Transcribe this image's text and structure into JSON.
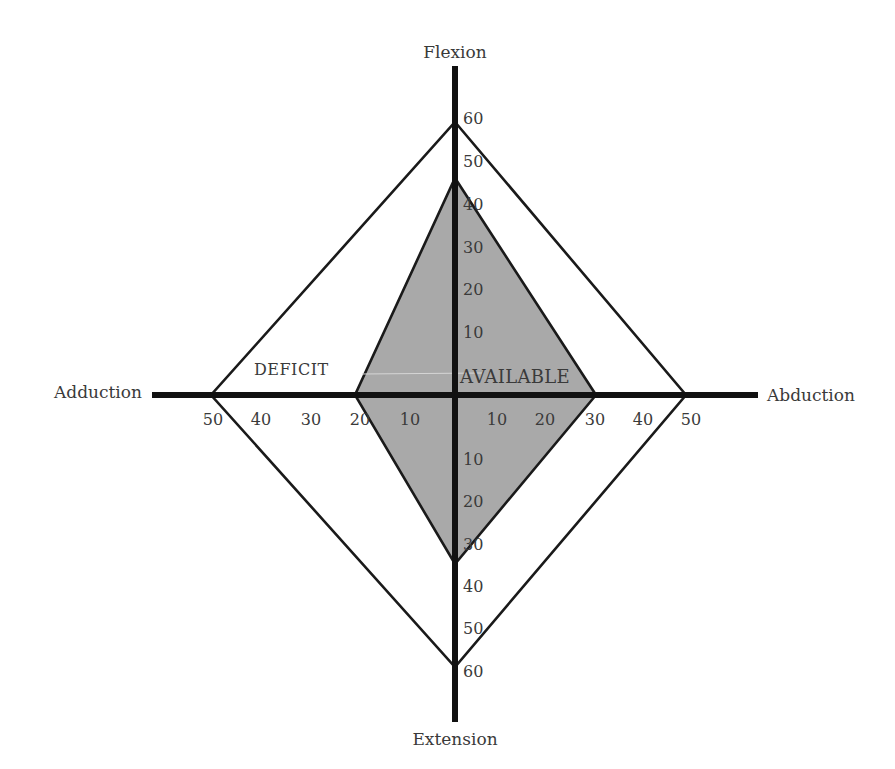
{
  "diagram": {
    "colors": {
      "axis": "#111111",
      "outline": "#1a1a1a",
      "available_fill": "#a9a9a9",
      "text": "#3a3a3a"
    },
    "axes": {
      "top_label": "Flexion",
      "bottom_label": "Extension",
      "left_label": "Adduction",
      "right_label": "Abduction"
    },
    "ticks": {
      "up": [
        "60",
        "50",
        "40",
        "30",
        "20",
        "10"
      ],
      "down": [
        "10",
        "20",
        "30",
        "40",
        "50",
        "60"
      ],
      "left": [
        "50",
        "40",
        "30",
        "20",
        "10"
      ],
      "right": [
        "10",
        "20",
        "30",
        "40",
        "50"
      ]
    },
    "regions": {
      "deficit_label": "DEFICIT",
      "available_label": "AVAILABLE"
    },
    "normal_range": {
      "flexion": 60,
      "extension": 60,
      "adduction": 50,
      "abduction": 50
    },
    "available_range": {
      "flexion": 47,
      "extension": 37,
      "adduction": 20,
      "abduction": 30
    }
  }
}
